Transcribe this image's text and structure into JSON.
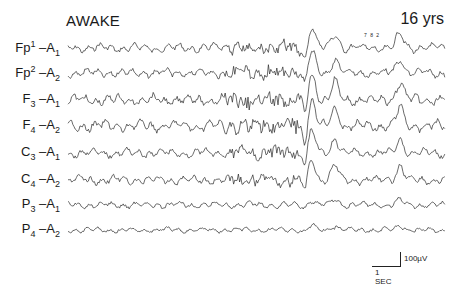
{
  "figure": {
    "title": "AWAKE",
    "age": "16 yrs",
    "marker": "7 8 2",
    "calibration": {
      "amplitude": "100µV",
      "time": "1 SEC"
    }
  },
  "channels": [
    {
      "base": "Fp",
      "sup": "1",
      "ref": "A",
      "refsub": "1",
      "y": 48,
      "amp": 4
    },
    {
      "base": "Fp",
      "sup": "2",
      "ref": "A",
      "refsub": "2",
      "y": 73,
      "amp": 4
    },
    {
      "base": "F",
      "sub": "3",
      "ref": "A",
      "refsub": "1",
      "y": 100,
      "amp": 5
    },
    {
      "base": "F",
      "sub": "4",
      "ref": "A",
      "refsub": "2",
      "y": 126,
      "amp": 5
    },
    {
      "base": "C",
      "sub": "3",
      "ref": "A",
      "refsub": "1",
      "y": 153,
      "amp": 4
    },
    {
      "base": "C",
      "sub": "4",
      "ref": "A",
      "refsub": "2",
      "y": 180,
      "amp": 4
    },
    {
      "base": "P",
      "sub": "3",
      "ref": "A",
      "refsub": "1",
      "y": 205,
      "amp": 3
    },
    {
      "base": "P",
      "sub": "4",
      "ref": "A",
      "refsub": "2",
      "y": 230,
      "amp": 2.5
    }
  ],
  "trace_layout": {
    "x_start": 68,
    "x_end": 445,
    "spike_x": [
      312,
      335,
      400
    ]
  }
}
